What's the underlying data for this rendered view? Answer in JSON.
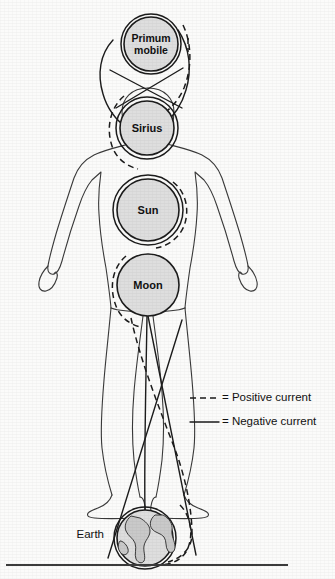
{
  "figure": {
    "background_color": "#fbfbfa",
    "ink_color": "#1c1c1c",
    "sphere_fill_color": "#dedede"
  },
  "spheres": [
    {
      "id": "primum-mobile",
      "label_line1": "Primum",
      "label_line2": "mobile",
      "label": "Primum mobile",
      "cx": 151,
      "cy": 44,
      "r": 27
    },
    {
      "id": "sirius",
      "label_line1": "Sirius",
      "label_line2": "",
      "label": "Sirius",
      "cx": 147,
      "cy": 128,
      "r": 27
    },
    {
      "id": "sun",
      "label_line1": "Sun",
      "label_line2": "",
      "label": "Sun",
      "cx": 148,
      "cy": 210,
      "r": 31
    },
    {
      "id": "moon",
      "label_line1": "Moon",
      "label_line2": "",
      "label": "Moon",
      "cx": 148,
      "cy": 285,
      "r": 31
    }
  ],
  "earth": {
    "id": "earth",
    "label": "Earth",
    "cx": 145,
    "cy": 538,
    "r": 28,
    "label_x": 104,
    "label_y": 535
  },
  "legend": {
    "items": [
      {
        "id": "positive-current",
        "style": "dashed",
        "equals": "=",
        "label": "Positive current",
        "text": "= Positive current",
        "y": 398
      },
      {
        "id": "negative-current",
        "style": "solid",
        "equals": "=",
        "label": "Negative current",
        "text": "= Negative current",
        "y": 422
      }
    ],
    "marker_x_start": 190,
    "marker_x_end": 219,
    "text_x": 222
  },
  "ground": {
    "id": "ground-line",
    "x1": 6,
    "x2": 288,
    "y": 565
  }
}
